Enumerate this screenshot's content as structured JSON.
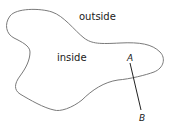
{
  "diagram": {
    "labels": {
      "outside": "outside",
      "inside": "inside",
      "point_a": "A",
      "point_b": "B"
    },
    "colors": {
      "curve": "#7a7a7a",
      "segment": "#222222",
      "text": "#1a1a1a"
    }
  }
}
